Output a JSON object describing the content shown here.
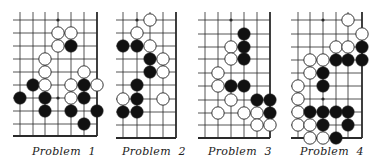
{
  "colors": {
    "background": "#ffffff",
    "line": "#2a2a2a",
    "black_stone": "#111111",
    "white_stone": "#ffffff",
    "stone_outline": "#222222"
  },
  "problems": [
    {
      "caption": "Problem  1",
      "cols_x": [
        20,
        33,
        45,
        58,
        71,
        84,
        97
      ],
      "rows_y": [
        20,
        33,
        46,
        59,
        72,
        85,
        98,
        111,
        124,
        136
      ],
      "right_edge": true,
      "bottom_edge": true,
      "hoshi": [
        [
          3,
          0
        ],
        [
          3,
          6
        ]
      ],
      "stones": [
        {
          "c": 3,
          "r": 1,
          "color": "W"
        },
        {
          "c": 4,
          "r": 1,
          "color": "W"
        },
        {
          "c": 3,
          "r": 2,
          "color": "W"
        },
        {
          "c": 4,
          "r": 2,
          "color": "B"
        },
        {
          "c": 2,
          "r": 3,
          "color": "W"
        },
        {
          "c": 2,
          "r": 4,
          "color": "W"
        },
        {
          "c": 5,
          "r": 4,
          "color": "W"
        },
        {
          "c": 1,
          "r": 5,
          "color": "B"
        },
        {
          "c": 2,
          "r": 5,
          "color": "W"
        },
        {
          "c": 4,
          "r": 5,
          "color": "W"
        },
        {
          "c": 5,
          "r": 5,
          "color": "B"
        },
        {
          "c": 6,
          "r": 5,
          "color": "W"
        },
        {
          "c": 0,
          "r": 6,
          "color": "B"
        },
        {
          "c": 2,
          "r": 6,
          "color": "B"
        },
        {
          "c": 4,
          "r": 6,
          "color": "W"
        },
        {
          "c": 5,
          "r": 6,
          "color": "B"
        },
        {
          "c": 2,
          "r": 7,
          "color": "B"
        },
        {
          "c": 4,
          "r": 7,
          "color": "B"
        },
        {
          "c": 6,
          "r": 7,
          "color": "B"
        },
        {
          "c": 5,
          "r": 8,
          "color": "B"
        }
      ],
      "caption_x": 32
    },
    {
      "caption": "Problem  2",
      "cols_x": [
        123,
        137,
        150,
        163,
        176
      ],
      "rows_y": [
        20,
        33,
        46,
        59,
        72,
        85,
        99,
        112,
        125,
        138
      ],
      "right_edge": true,
      "bottom_edge": true,
      "hoshi": [
        [
          1,
          0
        ]
      ],
      "stones": [
        {
          "c": 2,
          "r": 0,
          "color": "W"
        },
        {
          "c": 1,
          "r": 1,
          "color": "W"
        },
        {
          "c": 0,
          "r": 2,
          "color": "B"
        },
        {
          "c": 1,
          "r": 2,
          "color": "B"
        },
        {
          "c": 2,
          "r": 2,
          "color": "W"
        },
        {
          "c": 2,
          "r": 3,
          "color": "B"
        },
        {
          "c": 3,
          "r": 3,
          "color": "W"
        },
        {
          "c": 2,
          "r": 4,
          "color": "B"
        },
        {
          "c": 3,
          "r": 4,
          "color": "W"
        },
        {
          "c": 1,
          "r": 5,
          "color": "B"
        },
        {
          "c": 0,
          "r": 6,
          "color": "W"
        },
        {
          "c": 1,
          "r": 6,
          "color": "B"
        },
        {
          "c": 3,
          "r": 6,
          "color": "W"
        },
        {
          "c": 0,
          "r": 7,
          "color": "B"
        },
        {
          "c": 1,
          "r": 7,
          "color": "B"
        }
      ],
      "caption_x": 122
    },
    {
      "caption": "Problem  3",
      "cols_x": [
        205,
        218,
        231,
        244,
        257,
        270
      ],
      "rows_y": [
        20,
        34,
        47,
        59,
        73,
        86,
        100,
        113,
        125,
        138
      ],
      "right_edge": true,
      "bottom_edge": true,
      "hoshi": [
        [
          2,
          0
        ]
      ],
      "stones": [
        {
          "c": 3,
          "r": 1,
          "color": "B"
        },
        {
          "c": 2,
          "r": 2,
          "color": "W"
        },
        {
          "c": 3,
          "r": 2,
          "color": "B"
        },
        {
          "c": 2,
          "r": 3,
          "color": "W"
        },
        {
          "c": 3,
          "r": 3,
          "color": "B"
        },
        {
          "c": 1,
          "r": 4,
          "color": "W"
        },
        {
          "c": 1,
          "r": 5,
          "color": "W"
        },
        {
          "c": 2,
          "r": 5,
          "color": "B"
        },
        {
          "c": 3,
          "r": 5,
          "color": "B"
        },
        {
          "c": 2,
          "r": 6,
          "color": "W"
        },
        {
          "c": 4,
          "r": 6,
          "color": "B"
        },
        {
          "c": 5,
          "r": 6,
          "color": "B"
        },
        {
          "c": 1,
          "r": 7,
          "color": "W"
        },
        {
          "c": 3,
          "r": 7,
          "color": "W"
        },
        {
          "c": 4,
          "r": 7,
          "color": "W"
        },
        {
          "c": 5,
          "r": 7,
          "color": "B"
        },
        {
          "c": 4,
          "r": 8,
          "color": "W"
        },
        {
          "c": 5,
          "r": 8,
          "color": "W"
        }
      ],
      "caption_x": 208
    },
    {
      "caption": "Problem  4",
      "cols_x": [
        298,
        310,
        323,
        336,
        348,
        362
      ],
      "rows_y": [
        20,
        34,
        47,
        60,
        73,
        86,
        99,
        112,
        125,
        138
      ],
      "right_edge": true,
      "bottom_edge": true,
      "hoshi": [
        [
          2,
          0
        ],
        [
          2,
          6
        ]
      ],
      "stones": [
        {
          "c": 4,
          "r": 0,
          "color": "W"
        },
        {
          "c": 5,
          "r": 1,
          "color": "W"
        },
        {
          "c": 3,
          "r": 2,
          "color": "W"
        },
        {
          "c": 4,
          "r": 2,
          "color": "W"
        },
        {
          "c": 5,
          "r": 2,
          "color": "B"
        },
        {
          "c": 1,
          "r": 3,
          "color": "W"
        },
        {
          "c": 2,
          "r": 3,
          "color": "W"
        },
        {
          "c": 3,
          "r": 3,
          "color": "B"
        },
        {
          "c": 4,
          "r": 3,
          "color": "B"
        },
        {
          "c": 5,
          "r": 3,
          "color": "B"
        },
        {
          "c": 1,
          "r": 4,
          "color": "W"
        },
        {
          "c": 2,
          "r": 4,
          "color": "B"
        },
        {
          "c": 0,
          "r": 5,
          "color": "W"
        },
        {
          "c": 2,
          "r": 5,
          "color": "B"
        },
        {
          "c": 0,
          "r": 6,
          "color": "W"
        },
        {
          "c": 0,
          "r": 7,
          "color": "W"
        },
        {
          "c": 1,
          "r": 7,
          "color": "B"
        },
        {
          "c": 2,
          "r": 7,
          "color": "B"
        },
        {
          "c": 3,
          "r": 7,
          "color": "B"
        },
        {
          "c": 4,
          "r": 7,
          "color": "B"
        },
        {
          "c": 0,
          "r": 8,
          "color": "W"
        },
        {
          "c": 1,
          "r": 8,
          "color": "W"
        },
        {
          "c": 2,
          "r": 8,
          "color": "B"
        },
        {
          "c": 4,
          "r": 8,
          "color": "B"
        },
        {
          "c": 1,
          "r": 9,
          "color": "W"
        },
        {
          "c": 2,
          "r": 9,
          "color": "W"
        },
        {
          "c": 3,
          "r": 9,
          "color": "B"
        }
      ],
      "caption_x": 300
    }
  ]
}
